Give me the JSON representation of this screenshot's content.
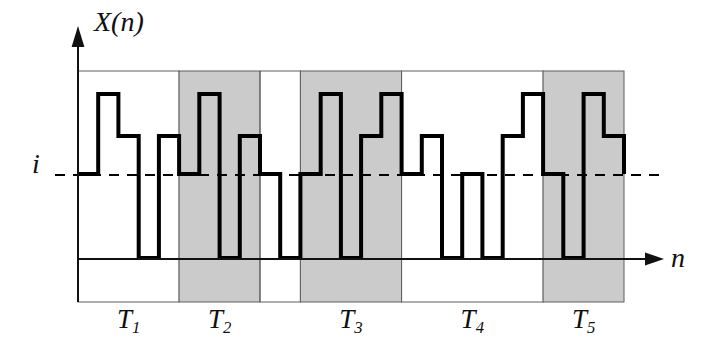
{
  "labels": {
    "y_axis": "X(n)",
    "x_axis": "n",
    "level": "i"
  },
  "t_labels": [
    {
      "base": "T",
      "sub": "1"
    },
    {
      "base": "T",
      "sub": "2"
    },
    {
      "base": "T",
      "sub": "3"
    },
    {
      "base": "T",
      "sub": "4"
    },
    {
      "base": "T",
      "sub": "5"
    }
  ],
  "regions": [
    {
      "label_index": 0,
      "shaded": false,
      "from_step": 0,
      "to_step": 5
    },
    {
      "label_index": 1,
      "shaded": true,
      "from_step": 5,
      "to_step": 9
    },
    {
      "label_index": null,
      "shaded": false,
      "from_step": 9,
      "to_step": 11
    },
    {
      "label_index": 2,
      "shaded": true,
      "from_step": 11,
      "to_step": 16
    },
    {
      "label_index": 3,
      "shaded": false,
      "from_step": 16,
      "to_step": 23
    },
    {
      "label_index": 4,
      "shaded": true,
      "from_step": 23,
      "to_step": 27
    }
  ],
  "waveform": {
    "type": "step",
    "num_steps": 27,
    "level_names": [
      "low",
      "i",
      "mid",
      "high"
    ],
    "start_level": "i",
    "end_level": "i",
    "sequence": [
      "i",
      "high",
      "mid",
      "low",
      "mid",
      "i",
      "high",
      "low",
      "mid",
      "i",
      "low",
      "i",
      "high",
      "low",
      "mid",
      "high",
      "i",
      "mid",
      "low",
      "i",
      "low",
      "mid",
      "high",
      "i",
      "low",
      "high",
      "mid"
    ]
  },
  "colors": {
    "shade": "#cbcbcb",
    "waveform": "#000000",
    "border": "#5f5f5f",
    "axis": "#111111",
    "background": "#ffffff"
  }
}
